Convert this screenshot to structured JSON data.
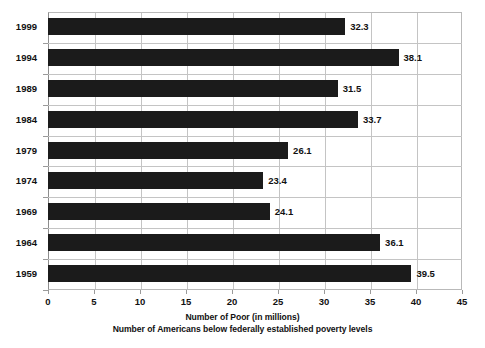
{
  "chart_data": {
    "type": "bar",
    "orientation": "horizontal",
    "title": "",
    "xlabel": "Number of Poor (in millions)",
    "xlabel2": "Number of Americans below federally established poverty levels",
    "ylabel": "",
    "categories": [
      "1999",
      "1994",
      "1989",
      "1984",
      "1979",
      "1974",
      "1969",
      "1964",
      "1959"
    ],
    "values": [
      32.3,
      38.1,
      31.5,
      33.7,
      26.1,
      23.4,
      24.1,
      36.1,
      39.5
    ],
    "value_labels": [
      "32.3",
      "38.1",
      "31.5",
      "33.7",
      "26.1",
      "23.4",
      "24.1",
      "36.1",
      "39.5"
    ],
    "xlim": [
      0,
      45
    ],
    "xticks": [
      0,
      5,
      10,
      15,
      20,
      25,
      30,
      35,
      40,
      45
    ],
    "xtick_labels": [
      "0",
      "5",
      "10",
      "15",
      "20",
      "25",
      "30",
      "35",
      "40",
      "45"
    ],
    "grid": true,
    "grid_axis": "x",
    "legend": "none",
    "bar_color": "#1b1b1b",
    "grid_color": "#c4c4c4",
    "background_color": "#ffffff",
    "text_color": "#111111"
  }
}
